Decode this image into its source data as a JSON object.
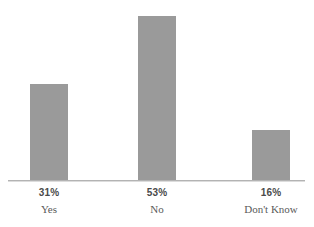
{
  "chart_data": {
    "type": "bar",
    "title": "",
    "subtitle": "",
    "xlabel": "",
    "ylabel": "",
    "categories": [
      "Yes",
      "No",
      "Don't Know"
    ],
    "values": [
      31,
      53,
      16
    ],
    "value_labels": [
      "31%",
      "53%",
      "16%"
    ],
    "ylim": [
      0,
      53
    ],
    "grid": false,
    "legend": false,
    "legend_position": "none",
    "axis": {
      "x_axis_visible": true,
      "y_axis_visible": false,
      "tick_marks": false
    },
    "colors": {
      "bar_fill": "#9a9a9a",
      "axis_line": "#b3b3b3",
      "background": "#ffffff",
      "value_label_text": "#4a4a4a",
      "category_label_text": "#5a5a5a"
    },
    "bars": [
      {
        "category": "Yes",
        "value": 31,
        "value_label": "31%",
        "height_pct": 58.5
      },
      {
        "category": "No",
        "value": 53,
        "value_label": "53%",
        "height_pct": 100
      },
      {
        "category": "Don't Know",
        "value": 16,
        "value_label": "16%",
        "height_pct": 31.7
      }
    ]
  }
}
